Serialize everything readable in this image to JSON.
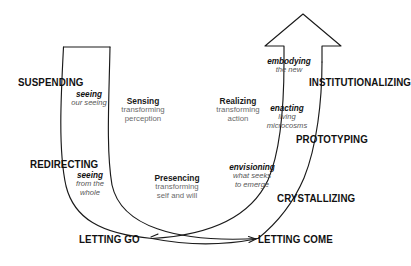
{
  "diagram": {
    "stroke_color": "#1a1a1a",
    "bold_text_color": "#111111",
    "gray_text_color": "#6a6a6a"
  },
  "stages": {
    "suspending": "SUSPENDING",
    "redirecting": "REDIRECTING",
    "letting_go": "LETTING GO",
    "letting_come": "LETTING COME",
    "crystallizing": "CRYSTALLIZING",
    "prototyping": "PROTOTYPING",
    "institutionalizing": "INSTITUTIONALIZING"
  },
  "italic_notes": {
    "seeing": {
      "bold": "seeing",
      "rest": "our seeing"
    },
    "seeing_whole": {
      "bold": "seeing",
      "rest": "from the\nwhole"
    },
    "envisioning": {
      "bold": "envisioning",
      "rest": "what seeks\nto emerge"
    },
    "enacting": {
      "bold": "enacting",
      "rest": "living\nmicrocosms"
    },
    "embodying": {
      "bold": "embodying",
      "rest": "the new"
    }
  },
  "process_notes": {
    "sensing": {
      "bold": "Sensing",
      "rest": "transforming\nperception"
    },
    "presencing": {
      "bold": "Presencing",
      "rest": "transforming\nself and will"
    },
    "realizing": {
      "bold": "Realizing",
      "rest": "transforming\naction"
    }
  }
}
